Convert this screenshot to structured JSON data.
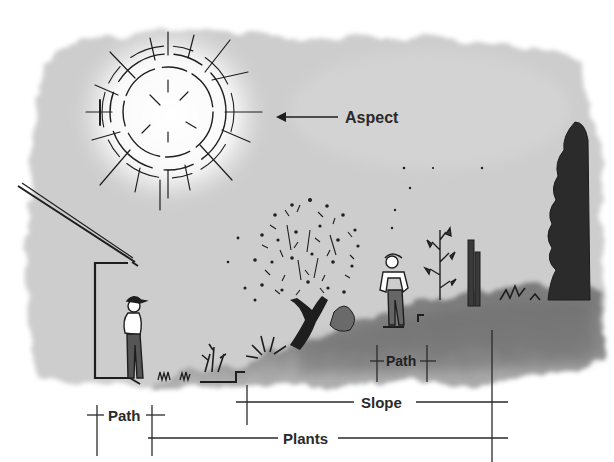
{
  "labels": {
    "aspect": "Aspect",
    "path_lower": "Path",
    "path_upper": "Path",
    "slope": "Slope",
    "plants": "Plants"
  },
  "colors": {
    "sky_wash": "#c9c9c9",
    "sky_light": "#e2e2e2",
    "ground_dark": "#6f6f6f",
    "ink": "#1e1e1e",
    "background": "#ffffff"
  },
  "elements": {
    "sun": "sun-icon",
    "house": "house-icon",
    "person_left": "person-icon",
    "person_right": "person-icon",
    "tree": "tree-icon",
    "conifer": "conifer-icon",
    "shrub": "shrub-icon",
    "fence_posts": "post-icon"
  }
}
